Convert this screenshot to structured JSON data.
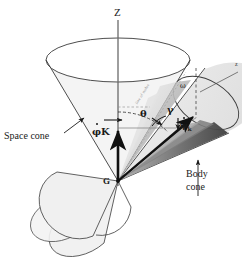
{
  "figure": {
    "type": "technical-diagram",
    "background": "#ffffff",
    "ink": "#1a1a1a"
  },
  "labels": {
    "z_axis": "Z",
    "z_axis_small": "z",
    "space_cone": "Space cone",
    "body_cone_line1": "Body",
    "body_cone_line2": "cone",
    "apex_point": "G",
    "phi_dot_K": "φK",
    "phi_symbol": "φ",
    "K_symbol": "K",
    "theta": "θ",
    "gamma": "γ",
    "omega": "ω",
    "psi_dot": "ψ",
    "psi_subscript": "k",
    "diagonal_faint": "line of nodes"
  },
  "colors": {
    "outline": "#3a3a3a",
    "vector_black": "#111111",
    "shade_light": "#e8e8e8",
    "shade_mid": "#c4c4c4",
    "shade_dark": "#8f8f8f",
    "shade_darker": "#5a5a5a",
    "cone_fill": "#f1f1f1",
    "dash": "#6d6d6d"
  },
  "geometry": {
    "apex_G": [
      118,
      181
    ],
    "z_tip": [
      118,
      18
    ],
    "space_cone_rim_center": [
      118,
      60
    ],
    "space_cone_rim_rx": 72,
    "space_cone_rim_ry": 22,
    "omega_tip": [
      196,
      114
    ],
    "psi_tip": [
      186,
      124
    ],
    "phi_tip": [
      118,
      128
    ]
  }
}
